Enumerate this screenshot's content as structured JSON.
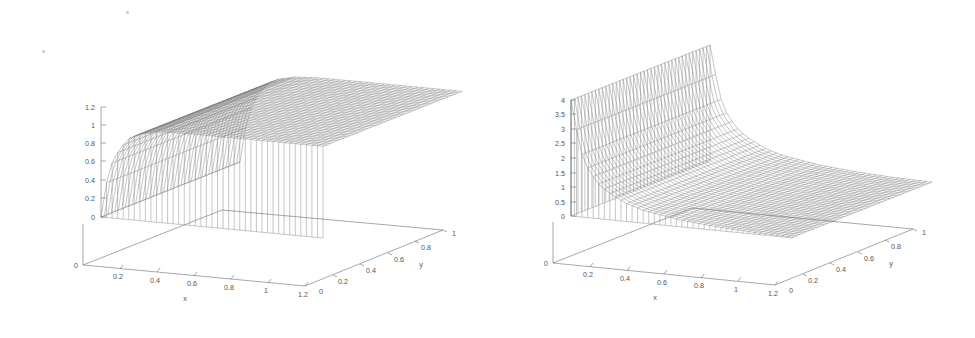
{
  "figure": {
    "title": "",
    "background_color": "#ffffff",
    "ink_color": "#555555",
    "panel_count": 2,
    "artifacts": [
      {
        "name": "scan-speck-top",
        "x": 126,
        "y": 11,
        "size": 3
      },
      {
        "name": "scan-speck-left",
        "x": 42,
        "y": 50,
        "size": 3
      }
    ]
  },
  "chart_data": [
    {
      "type": "surface",
      "name": "left-surface-plot",
      "title": "",
      "xlabel": "x",
      "ylabel": "y",
      "zlabel": "",
      "xlim": [
        0,
        1.2
      ],
      "ylim": [
        0,
        1
      ],
      "zlim": [
        0,
        1.2
      ],
      "xticks": [
        "0",
        "0.2",
        "0.4",
        "0.6",
        "0.8",
        "1",
        "1.2"
      ],
      "xtick_values": [
        0,
        0.2,
        0.4,
        0.6,
        0.8,
        1,
        1.2
      ],
      "yticks": [
        "0",
        "0.2",
        "0.4",
        "0.6",
        "0.8",
        "1"
      ],
      "ytick_values": [
        0,
        0.2,
        0.4,
        0.6,
        0.8,
        1
      ],
      "zticks": [
        "0",
        "0.2",
        "0.4",
        "0.6",
        "0.8",
        "1",
        "1.2"
      ],
      "ztick_values": [
        0,
        0.2,
        0.4,
        0.6,
        0.8,
        1,
        1.2
      ],
      "origin_label": "0",
      "grid": false,
      "legend": "none",
      "mesh": {
        "nx": 41,
        "ny": 41,
        "style": "wireframe",
        "color": "#6a6a6a"
      },
      "surface_description": "z rises steeply from 0 near x=0 and saturates to a flat plateau at z=1 for larger x; nearly independent of y",
      "z_profile_x": [
        0,
        0.03,
        0.06,
        0.1,
        0.15,
        0.2,
        0.3,
        0.4,
        0.6,
        0.8,
        1.0,
        1.2
      ],
      "z_profile_z": [
        0,
        0.38,
        0.6,
        0.76,
        0.88,
        0.94,
        0.985,
        0.997,
        1.0,
        1.0,
        1.0,
        1.0
      ]
    },
    {
      "type": "surface",
      "name": "right-surface-plot",
      "title": "",
      "xlabel": "x",
      "ylabel": "y",
      "zlabel": "",
      "xlim": [
        0,
        1.2
      ],
      "ylim": [
        0,
        1
      ],
      "zlim": [
        0,
        4
      ],
      "xticks": [
        "0",
        "0.2",
        "0.4",
        "0.6",
        "0.8",
        "1",
        "1.2"
      ],
      "xtick_values": [
        0,
        0.2,
        0.4,
        0.6,
        0.8,
        1,
        1.2
      ],
      "yticks": [
        "0",
        "0.2",
        "0.4",
        "0.6",
        "0.8",
        "1"
      ],
      "ytick_values": [
        0,
        0.2,
        0.4,
        0.6,
        0.8,
        1
      ],
      "zticks": [
        "0",
        "0.5",
        "1",
        "1.5",
        "2",
        "2.5",
        "3",
        "3.5",
        "4"
      ],
      "ztick_values": [
        0,
        0.5,
        1,
        1.5,
        2,
        2.5,
        3,
        3.5,
        4
      ],
      "origin_label": "0",
      "grid": false,
      "legend": "none",
      "mesh": {
        "nx": 41,
        "ny": 41,
        "style": "wireframe",
        "color": "#6a6a6a"
      },
      "surface_description": "z blows up near x=0 reaching about 4, decaying monotonically toward 0 as x grows; singular derivative-like profile, weak y dependence",
      "z_profile_x": [
        0.01,
        0.02,
        0.04,
        0.07,
        0.1,
        0.15,
        0.2,
        0.3,
        0.4,
        0.6,
        0.8,
        1.0,
        1.2
      ],
      "z_profile_z": [
        4.0,
        3.4,
        2.6,
        1.95,
        1.6,
        1.2,
        0.95,
        0.62,
        0.43,
        0.23,
        0.12,
        0.06,
        0.03
      ]
    }
  ]
}
